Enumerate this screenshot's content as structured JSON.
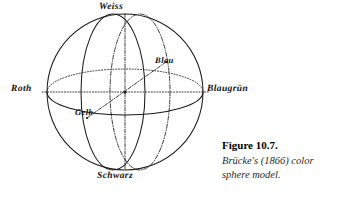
{
  "figure": {
    "background_color": "#ffffff",
    "ink_color": "#1a1a1a",
    "sphere": {
      "center_x": 125,
      "center_y": 92,
      "radius": 78,
      "outline_style": "solid"
    },
    "axis_labels": {
      "top": "Weiss",
      "left": "Roth",
      "right": "Blaugrün",
      "bottom": "Schwarz",
      "upper_right_interior": "Blau",
      "lower_left_interior": "Gelb"
    },
    "axes": [
      {
        "name": "vertical-axis",
        "from": "Weiss",
        "to": "Schwarz",
        "style": "dash-dot"
      },
      {
        "name": "horizontal-axis",
        "from": "Roth",
        "to": "Blaugrün",
        "style": "dotted"
      },
      {
        "name": "diagonal-axis",
        "from": "Gelb",
        "to": "Blau",
        "style": "dash-dot"
      }
    ],
    "great_circles": [
      {
        "name": "equator-ellipse",
        "orientation": "horizontal",
        "front_half_style": "solid",
        "back_half_style": "dotted"
      },
      {
        "name": "front-meridian-ellipse",
        "orientation": "vertical-left",
        "style": "solid"
      },
      {
        "name": "back-meridian-ellipse",
        "orientation": "vertical-right",
        "style": "dash-dot"
      }
    ]
  },
  "caption": {
    "number": "Figure 10.7.",
    "text": "Brücke's (1866) color sphere model."
  }
}
